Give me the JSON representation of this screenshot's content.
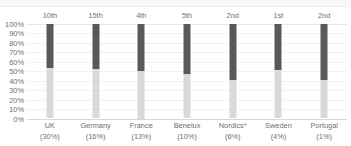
{
  "chart_data": {
    "type": "bar",
    "subtype": "stacked-100-percent",
    "title": "",
    "subtitle": "",
    "xlabel": "",
    "ylabel": "",
    "ylim": [
      0,
      100
    ],
    "grid": true,
    "legend": "none",
    "categories": [
      "UK",
      "Germany",
      "France",
      "Benelux",
      "Nordics*",
      "Sweden",
      "Portugal"
    ],
    "category_shares": [
      "(30%)",
      "(16%)",
      "(13%)",
      "(10%)",
      "(6%)",
      "(4%)",
      "(1%)"
    ],
    "rank_labels": [
      "10th",
      "15th",
      "4th",
      "5th",
      "2nd",
      "1st",
      "2nd"
    ],
    "ytick_labels": [
      "100%",
      "90%",
      "80%",
      "70%",
      "60%",
      "50%",
      "40%",
      "30%",
      "20%",
      "10%",
      "0%"
    ],
    "ytick_values": [
      100,
      90,
      80,
      70,
      60,
      50,
      40,
      30,
      20,
      10,
      0
    ],
    "series": [
      {
        "name": "upper-segment",
        "color": "#595959",
        "values": [
          47,
          48,
          50,
          53,
          59,
          49,
          59
        ]
      },
      {
        "name": "lower-segment",
        "color": "#d9d9d9",
        "values": [
          53,
          52,
          50,
          47,
          41,
          51,
          41
        ]
      }
    ],
    "colors": {
      "upper_segment": "#595959",
      "lower_segment": "#d9d9d9",
      "gridline": "#f0f1f3",
      "baseline": "#d5d7da",
      "text": "#6f6f6f",
      "background": "#ffffff"
    }
  }
}
